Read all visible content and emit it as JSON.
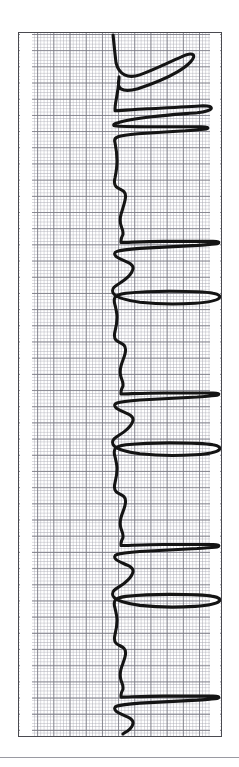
{
  "document": {
    "kind": "ecg-rhythm-strip",
    "orientation": "rotated-90-clockwise",
    "caption": ""
  },
  "paper": {
    "background_color": "#ffffff",
    "frame_color": "#4a4a50",
    "grid_bold_color": "#787882",
    "grid_fine_color": "#aaaab4",
    "trace_color": "#141414",
    "divider_color": "#9a9aa2",
    "frame": {
      "left": 18,
      "top": 32,
      "width": 204,
      "height": 705
    },
    "grid": {
      "fine_cell_px": 3.24,
      "bold_cell_px": 16.2,
      "bold_every_n_fine": 5
    }
  },
  "chart_data": {
    "type": "line",
    "title": "",
    "subtitle": "",
    "xlabel": "",
    "ylabel": "",
    "legend": [],
    "grid": true,
    "axis_orientation": {
      "time_axis": "vertical-downward",
      "voltage_axis": "horizontal-rightward"
    },
    "baseline_offset_px": 97,
    "beat_count": 7,
    "beats": [
      {
        "index": 1,
        "t_px": 55,
        "r_peak_px": 185,
        "s_trough_px": 60,
        "t_wave_px": 150
      },
      {
        "index": 2,
        "t_px": 160,
        "r_peak_px": 182,
        "s_trough_px": 62,
        "t_wave_px": 148
      },
      {
        "index": 3,
        "t_px": 262,
        "r_peak_px": 184,
        "s_trough_px": 58,
        "t_wave_px": 152
      },
      {
        "index": 4,
        "t_px": 366,
        "r_peak_px": 183,
        "s_trough_px": 55,
        "t_wave_px": 150
      },
      {
        "index": 5,
        "t_px": 470,
        "r_peak_px": 186,
        "s_trough_px": 58,
        "t_wave_px": 149
      },
      {
        "index": 6,
        "t_px": 575,
        "r_peak_px": 184,
        "s_trough_px": 54,
        "t_wave_px": 151
      },
      {
        "index": 7,
        "t_px": 676,
        "r_peak_px": 180,
        "s_trough_px": 60,
        "t_wave_px": 147
      }
    ],
    "series": [
      {
        "name": "Lead II",
        "path": "M 95,2 C 96,12 97,22 98,30 C 101,42 110,46 122,42 C 136,37 150,30 164,24 C 170,21 174,20 176,22 C 178,25 172,32 160,39 C 148,46 132,52 120,56 C 112,58 106,58 103,56 C 100,54 100,50 101,46 L 101,44 C 101,50 100,56 99,62 C 98,68 97,72 97,76 L 97,78 C 100,78 112,77 130,76 C 150,75 172,74 186,73 C 192,73 195,74 194,76 C 193,78 188,79 180,80 C 168,81 150,82 134,84 C 118,86 106,88 100,90 C 96,91 95,92 96,93 C 98,94 110,94 128,94 C 148,94 170,94 184,94 C 190,94 192,95 190,96 C 188,97 180,97 168,98 C 152,99 134,100 120,101 C 110,102 103,103 100,104 C 97,105 96,107 97,110 C 98,115 99,122 99,128 C 99,134 98,140 97,145 C 96,149 96,152 98,154 C 100,156 104,157 106,159 C 108,161 108,164 107,168 C 106,173 104,178 103,182 C 102,186 102,190 103,193 C 104,196 105,198 105,200 L 105,202 C 104,204 103,206 103,208 L 103,210 C 110,210 126,209 146,209 C 166,209 186,209 196,209 C 201,209 203,210 201,211 C 199,212 192,212 180,213 C 162,214 140,215 122,216 C 110,217 102,218 99,219 C 96,220 96,222 98,224 C 100,226 106,228 110,230 C 114,232 116,234 115,237 C 114,241 110,245 106,248 C 102,251 98,253 96,255 C 94,257 94,260 96,262 C 99,265 108,268 122,270 C 140,272 162,272 178,271 C 192,270 200,268 202,266 C 204,264 202,262 196,261 C 186,259 170,259 152,259 C 134,259 118,260 108,261 C 101,262 98,263 97,265 C 96,267 96,270 97,273 C 98,277 99,281 99,285 C 99,290 98,295 97,299 C 96,303 96,306 98,308 C 100,310 104,311 106,313 C 108,315 108,318 107,322 C 106,326 104,330 103,334 C 102,338 102,342 103,345 C 104,348 105,350 105,352 L 105,354 C 104,356 103,358 103,360 L 103,362 C 110,362 126,361 146,361 C 166,361 186,361 196,361 C 201,361 203,362 201,363 C 199,364 192,364 180,365 C 162,366 140,367 122,368 C 110,369 102,370 99,371 C 96,372 96,374 98,376 C 100,378 106,380 110,382 C 114,384 116,386 115,389 C 114,393 110,397 106,400 C 102,403 98,405 96,407 C 94,409 94,412 96,414 C 99,417 108,420 122,422 C 140,424 162,424 178,423 C 192,422 200,420 202,418 C 204,416 202,414 196,413 C 186,411 170,411 152,411 C 134,411 118,412 108,413 C 101,414 98,415 97,417 C 96,419 96,422 97,425 C 98,429 99,433 99,437 C 99,442 98,447 97,451 C 96,455 96,458 98,460 C 100,462 104,463 106,465 C 108,467 108,470 107,474 C 106,478 104,482 103,486 C 102,490 102,494 103,497 C 104,500 105,502 105,504 L 105,506 C 104,508 103,510 103,512 L 103,514 C 110,514 126,513 146,513 C 166,513 186,513 196,513 C 201,513 203,514 201,515 C 199,516 192,516 180,517 C 162,518 140,519 122,520 C 110,521 102,522 99,523 C 96,524 96,526 98,528 C 100,530 106,532 110,534 C 114,536 116,538 115,541 C 114,545 110,549 106,552 C 102,555 98,557 96,559 C 94,561 94,564 96,566 C 99,569 108,572 122,574 C 140,576 162,576 178,575 C 192,574 200,572 202,570 C 204,568 202,566 196,565 C 186,563 170,563 152,563 C 134,563 118,564 108,565 C 101,566 98,567 97,569 C 96,571 96,574 97,577 C 98,581 99,585 99,589 C 99,594 98,599 97,603 C 96,607 96,610 98,612 C 100,614 104,615 106,617 C 108,619 108,622 107,626 C 106,630 104,634 103,638 C 102,642 102,646 103,649 C 104,652 105,654 105,656 L 105,658 C 104,660 103,662 103,664 L 103,666 C 110,666 126,665 146,665 C 166,665 186,665 196,665 C 201,665 203,666 201,667 C 199,668 192,668 180,669 C 162,670 140,671 122,672 C 110,673 102,674 99,675 C 96,676 96,678 98,680 C 100,682 106,684 110,686 C 114,688 116,690 115,693 C 114,697 110,700 106,702 L 105,703"
      }
    ]
  }
}
